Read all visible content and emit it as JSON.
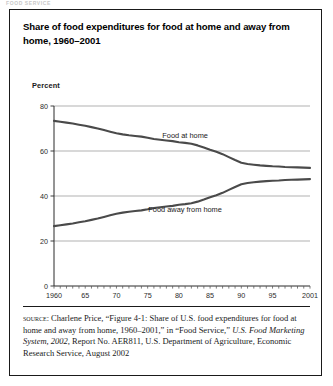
{
  "page": {
    "cutoff_header": "FOOD SERVICE",
    "width": 333,
    "height": 386
  },
  "figure": {
    "title": "Share of food expenditures for food at home and away from home, 1960–2001",
    "axis_note": "Percent"
  },
  "source": {
    "label": "source:",
    "text_part1": " Charlene Price, “Figure 4-1: Share of U.S. food expenditures for food at home and away from home, 1960–2001,” in “Food Service,” ",
    "italic_part": "U.S. Food Marketing System, 2002",
    "text_part2": ", Report No. AER811, U.S. Department of Agriculture, Economic Research Service, August 2002"
  },
  "colors": {
    "frame": "#1a1a1a",
    "line": "#4a4a4a",
    "grid": "#8f8f8f",
    "text": "#1a1a1a",
    "background": "#ffffff"
  },
  "chart_data": {
    "type": "line",
    "title": "Share of food expenditures for food at home and away from home, 1960–2001",
    "xlabel": "",
    "ylabel": "Percent",
    "xlim": [
      1960,
      2001
    ],
    "ylim": [
      0,
      80
    ],
    "yticks": [
      0,
      20,
      40,
      60,
      80
    ],
    "xticks": [
      1960,
      1965,
      1970,
      1975,
      1980,
      1985,
      1990,
      1995,
      2001
    ],
    "xtick_labels": [
      "1960",
      "65",
      "70",
      "75",
      "80",
      "85",
      "90",
      "95",
      "2001"
    ],
    "grid": true,
    "legend": "inline-annotations",
    "annotations": [
      {
        "text": "Food at home",
        "x": 1981,
        "y": 66
      },
      {
        "text": "Food away from home",
        "x": 1981,
        "y": 33
      }
    ],
    "x": [
      1960,
      1961,
      1962,
      1963,
      1964,
      1965,
      1966,
      1967,
      1968,
      1969,
      1970,
      1971,
      1972,
      1973,
      1974,
      1975,
      1976,
      1977,
      1978,
      1979,
      1980,
      1981,
      1982,
      1983,
      1984,
      1985,
      1986,
      1987,
      1988,
      1989,
      1990,
      1991,
      1992,
      1993,
      1994,
      1995,
      1996,
      1997,
      1998,
      1999,
      2000,
      2001
    ],
    "series": [
      {
        "name": "Food at home",
        "values": [
          73.4,
          73.0,
          72.6,
          72.2,
          71.7,
          71.2,
          70.6,
          70.0,
          69.3,
          68.6,
          67.9,
          67.4,
          67.0,
          66.7,
          66.4,
          65.9,
          65.3,
          65.0,
          64.7,
          64.4,
          63.9,
          63.6,
          63.2,
          62.5,
          61.6,
          60.6,
          59.7,
          58.6,
          57.3,
          56.0,
          54.8,
          54.2,
          53.9,
          53.6,
          53.4,
          53.2,
          53.1,
          52.9,
          52.8,
          52.7,
          52.6,
          52.5
        ]
      },
      {
        "name": "Food away from home",
        "values": [
          26.6,
          27.0,
          27.4,
          27.8,
          28.3,
          28.8,
          29.4,
          30.0,
          30.7,
          31.4,
          32.1,
          32.6,
          33.0,
          33.3,
          33.6,
          34.1,
          34.7,
          35.0,
          35.3,
          35.6,
          36.1,
          36.4,
          36.8,
          37.5,
          38.4,
          39.4,
          40.3,
          41.4,
          42.7,
          44.0,
          45.2,
          45.8,
          46.1,
          46.4,
          46.6,
          46.8,
          46.9,
          47.1,
          47.2,
          47.3,
          47.4,
          47.5
        ]
      }
    ]
  }
}
